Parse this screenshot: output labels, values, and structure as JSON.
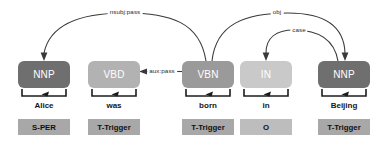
{
  "diagram": {
    "type": "dependency-parse",
    "sentence": "Alice was born in Beijing",
    "background_color": "#ffffff"
  },
  "tokens": [
    {
      "index": 0,
      "word": "Alice",
      "pos": "NNP",
      "tag": "S-PER",
      "pos_color": "#6f6f6f",
      "tag_color": "#a8a8a8",
      "x": 18,
      "width": 52,
      "center": 44
    },
    {
      "index": 1,
      "word": "was",
      "pos": "VBD",
      "tag": "T-Trigger",
      "pos_color": "#b2b2b2",
      "tag_color": "#a8a8a8",
      "x": 88,
      "width": 52,
      "center": 114
    },
    {
      "index": 2,
      "word": "born",
      "pos": "VBN",
      "tag": "T-Trigger",
      "pos_color": "#9a9a9a",
      "tag_color": "#a8a8a8",
      "x": 182,
      "width": 52,
      "center": 208
    },
    {
      "index": 3,
      "word": "in",
      "pos": "IN",
      "tag": "O",
      "pos_color": "#c9c9c9",
      "tag_color": "#bdbdbd",
      "x": 240,
      "width": 52,
      "center": 266
    },
    {
      "index": 4,
      "word": "Beijing",
      "pos": "NNP",
      "tag": "T-Trigger",
      "pos_color": "#6f6f6f",
      "tag_color": "#a8a8a8",
      "x": 318,
      "width": 52,
      "center": 344
    }
  ],
  "dependencies": [
    {
      "label": "nsubj:pass",
      "head_index": 2,
      "dependent_index": 0,
      "label_x": 125,
      "label_y": 11,
      "style": "arc-above"
    },
    {
      "label": "obj",
      "head_index": 2,
      "dependent_index": 4,
      "label_x": 277,
      "label_y": 11,
      "style": "arc-above"
    },
    {
      "label": "case",
      "head_index": 4,
      "dependent_index": 3,
      "label_x": 299,
      "label_y": 29,
      "style": "arc-above"
    },
    {
      "label": "aux:pass",
      "head_index": 2,
      "dependent_index": 1,
      "label_x": 161,
      "label_y": 68,
      "style": "straight-horizontal"
    }
  ],
  "colors": {
    "arc_stroke": "#3a3a3a",
    "bracket_stroke": "#1c1c1c",
    "pos_text": "#ffffff",
    "word_text": "#151515",
    "tag_text": "#101010"
  }
}
